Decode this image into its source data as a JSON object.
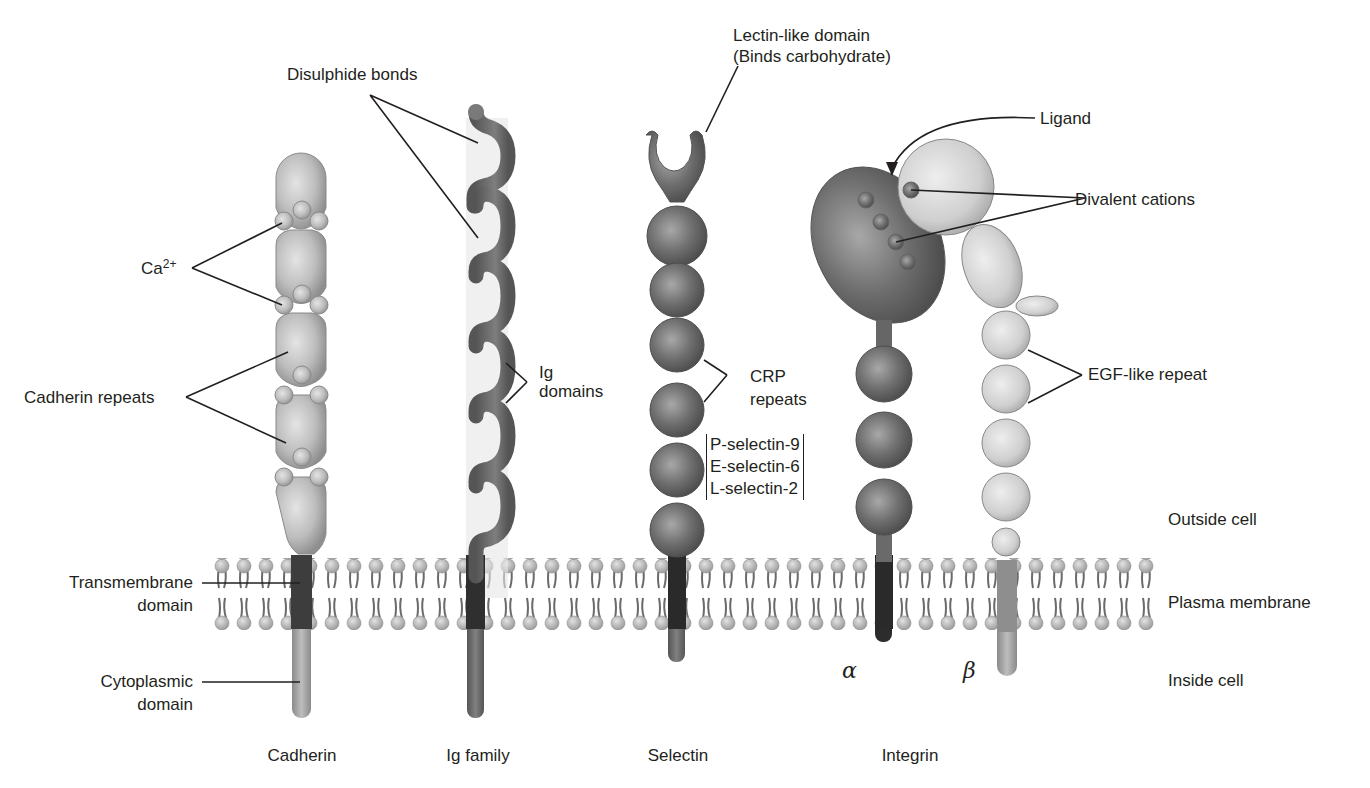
{
  "figure": {
    "molecules": [
      {
        "id": "cadherin",
        "label": "Cadherin"
      },
      {
        "id": "ig",
        "label": "Ig family"
      },
      {
        "id": "selectin",
        "label": "Selectin"
      },
      {
        "id": "integrin",
        "label": "Integrin"
      }
    ],
    "callouts": {
      "disulphide": "Disulphide bonds",
      "lectin_line1": "Lectin-like domain",
      "lectin_line2": "(Binds carbohydrate)",
      "ligand": "Ligand",
      "divalent": "Divalent cations",
      "ca_base": "Ca",
      "ca_sup": "2+",
      "cadherin_repeats": "Cadherin repeats",
      "ig_domains_1": "Ig",
      "ig_domains_2": "domains",
      "crp_1": "CRP",
      "crp_2": "repeats",
      "egf": "EGF-like repeat",
      "transmembrane_1": "Transmembrane",
      "transmembrane_2": "domain",
      "cytoplasmic_1": "Cytoplasmic",
      "cytoplasmic_2": "domain"
    },
    "selectin_variants": [
      "P-selectin-9",
      "E-selectin-6",
      "L-selectin-2"
    ],
    "subunits": {
      "alpha": "α",
      "beta": "β"
    },
    "regions": {
      "outside": "Outside cell",
      "membrane": "Plasma membrane",
      "inside": "Inside cell"
    }
  },
  "colors": {
    "light_domain": "#b9b9b9",
    "dark_domain": "#6d6d6d",
    "transmembrane": "#3a3a3a",
    "lipid_head": "#bdbdbd",
    "lipid_tail": "#6a6a6a",
    "text": "#231f20"
  }
}
